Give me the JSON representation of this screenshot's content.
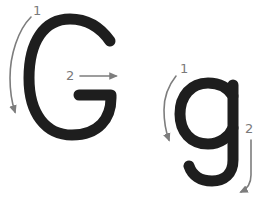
{
  "colors": {
    "letter": "#1e1e1e",
    "arrow": "#7d7d7d",
    "background": "#ffffff"
  },
  "letters": [
    {
      "glyph": "G",
      "case": "uppercase",
      "strokes": [
        {
          "number": "1",
          "direction": "counter-clockwise curve down"
        },
        {
          "number": "2",
          "direction": "right"
        }
      ]
    },
    {
      "glyph": "g",
      "case": "lowercase",
      "strokes": [
        {
          "number": "1",
          "direction": "counter-clockwise curve down"
        },
        {
          "number": "2",
          "direction": "down then hook left"
        }
      ]
    }
  ]
}
